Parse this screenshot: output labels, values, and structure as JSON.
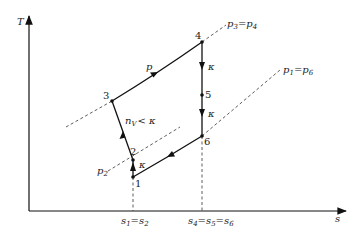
{
  "diagram": {
    "axes": {
      "y_label": "T",
      "x_label": "s"
    },
    "points": [
      {
        "id": "1",
        "label": "1",
        "x": 133,
        "y": 177
      },
      {
        "id": "2",
        "label": "2",
        "x": 133,
        "y": 160
      },
      {
        "id": "3",
        "label": "3",
        "x": 112,
        "y": 101
      },
      {
        "id": "4",
        "label": "4",
        "x": 202,
        "y": 42
      },
      {
        "id": "5",
        "label": "5",
        "x": 202,
        "y": 95
      },
      {
        "id": "6",
        "label": "6",
        "x": 202,
        "y": 136
      }
    ],
    "process_labels": {
      "p_3_4": "p",
      "n_2_3_main": "n",
      "n_2_3_sub": "V",
      "n_2_3_rest": "< κ",
      "kappa_1_2": "κ",
      "kappa_4_5": "κ",
      "kappa_5_6": "κ"
    },
    "isobars": {
      "p34": {
        "a": "p",
        "a_sub": "3",
        "eq": "=",
        "b": "p",
        "b_sub": "4"
      },
      "p16": {
        "a": "p",
        "a_sub": "1",
        "eq": "=",
        "b": "p",
        "b_sub": "6"
      },
      "p2": {
        "a": "p",
        "a_sub": "2"
      }
    },
    "entropy_ticks": {
      "left": {
        "a": "s",
        "a_sub": "1",
        "eq": "=",
        "b": "s",
        "b_sub": "2"
      },
      "right": {
        "a": "s",
        "a_sub": "4",
        "eq1": "=",
        "b": "s",
        "b_sub": "5",
        "eq2": "=",
        "c": "s",
        "c_sub": "6"
      }
    }
  }
}
